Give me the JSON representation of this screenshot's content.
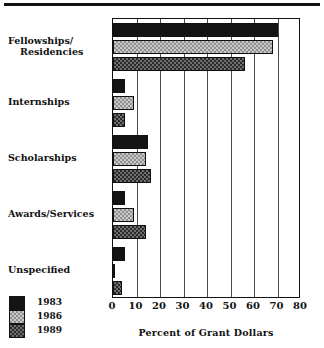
{
  "chart_data": {
    "type": "bar",
    "orientation": "horizontal",
    "title": "",
    "xlabel": "Percent of  Grant Dollars",
    "ylabel": "",
    "xlim": [
      0,
      80
    ],
    "xticks": [
      0,
      10,
      20,
      30,
      40,
      50,
      60,
      70,
      80
    ],
    "grid": true,
    "legend_position": "bottom-left",
    "categories": [
      "Fellowships/\nResidencies",
      "Internships",
      "Scholarships",
      "Awards/Services",
      "Unspecified"
    ],
    "series": [
      {
        "name": "1983",
        "color": "#141414",
        "pattern": "solid-black",
        "values": [
          70,
          5,
          15,
          5,
          5
        ]
      },
      {
        "name": "1986",
        "color": "#c9c9c9",
        "pattern": "light-checker",
        "values": [
          68,
          9,
          14,
          9,
          1
        ]
      },
      {
        "name": "1989",
        "color": "#6e6e6e",
        "pattern": "dark-checker",
        "values": [
          56,
          5,
          16,
          14,
          4
        ]
      }
    ]
  },
  "axis": {
    "tick_labels": [
      "0",
      "10",
      "20",
      "30",
      "40",
      "50",
      "60",
      "70",
      "80"
    ],
    "title": "Percent of  Grant Dollars"
  },
  "categories": {
    "items": [
      {
        "line1": "Fellowships/",
        "line2": "Residencies"
      },
      {
        "line1": "Internships",
        "line2": ""
      },
      {
        "line1": "Scholarships",
        "line2": ""
      },
      {
        "line1": "Awards/Services",
        "line2": ""
      },
      {
        "line1": "Unspecified",
        "line2": ""
      }
    ]
  },
  "legend": {
    "items": [
      {
        "label": "1983"
      },
      {
        "label": "1986"
      },
      {
        "label": "1989"
      }
    ]
  }
}
